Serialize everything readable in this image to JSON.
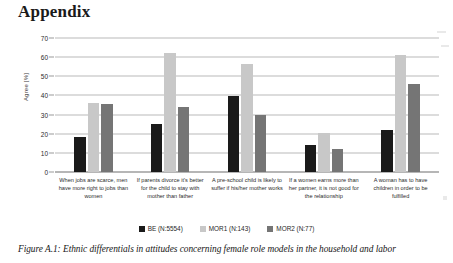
{
  "page_title": "Appendix",
  "caption": "Figure A.1: Ethnic differentials in attitudes concerning female role models in the household and labor",
  "colors": {
    "series_be": "#1a1a1a",
    "series_mor1": "#c8c8c8",
    "series_mor2": "#757575",
    "gridline": "#b9b9b9",
    "axis": "#6e6e6e",
    "text": "#1f1f1f"
  },
  "legend": {
    "items": [
      {
        "label": "BE (N:5554)",
        "color": "#1a1a1a"
      },
      {
        "label": "MOR1 (N:143)",
        "color": "#c8c8c8"
      },
      {
        "label": "MOR2 (N:77)",
        "color": "#757575"
      }
    ]
  },
  "chart_data": {
    "type": "bar",
    "title": "",
    "xlabel": "",
    "ylabel": "Agree [%]",
    "ylim": [
      0,
      70
    ],
    "yticks": [
      0,
      10,
      20,
      30,
      40,
      50,
      60,
      70
    ],
    "grid": true,
    "legend_position": "bottom",
    "categories": [
      "When jobs are scarce, men have more right to jobs than women",
      "If parents divorce it's better for the child to stay with mother than father",
      "A pre-school child is likely to suffer if his/her mother works",
      "If a women earns more than her partner, it is not good for the relationship",
      "A woman has to have children in order to be fulfilled"
    ],
    "series": [
      {
        "name": "BE (N:5554)",
        "color": "#1a1a1a",
        "values": [
          18.5,
          25,
          39.5,
          14,
          22
        ]
      },
      {
        "name": "MOR1 (N:143)",
        "color": "#c8c8c8",
        "values": [
          36,
          62,
          56.5,
          20.5,
          61
        ]
      },
      {
        "name": "MOR2 (N:77)",
        "color": "#757575",
        "values": [
          35.5,
          34,
          30,
          12,
          46
        ]
      }
    ]
  }
}
